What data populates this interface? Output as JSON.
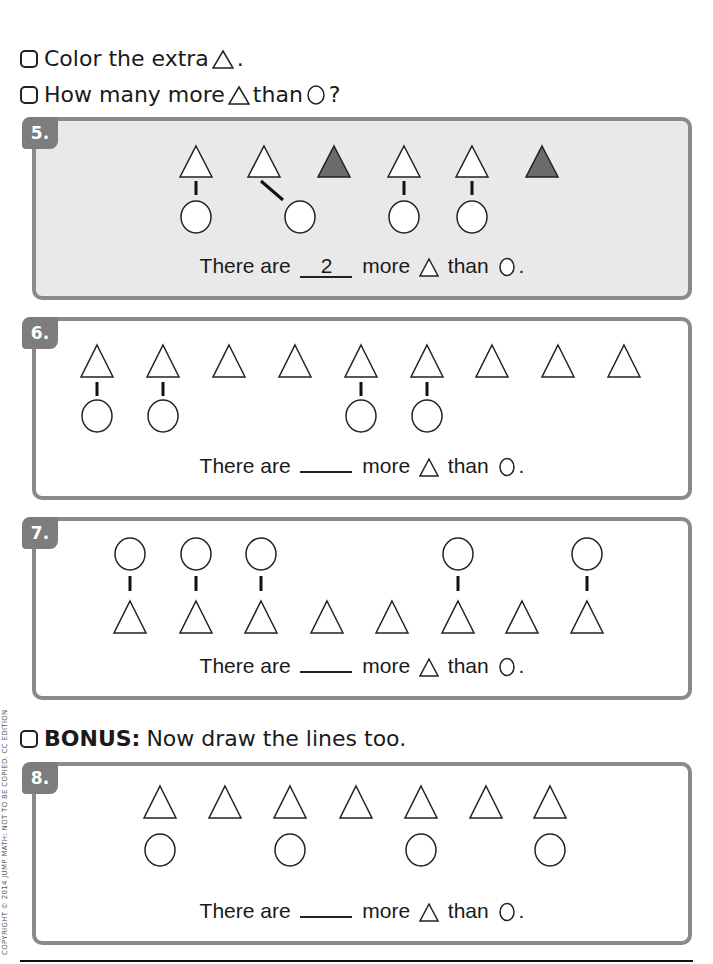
{
  "instructions": [
    {
      "text": "Color the extra",
      "suffix": "."
    },
    {
      "text": "How many more",
      "middle": "than",
      "suffix": "?"
    }
  ],
  "bonus": {
    "label": "BONUS:",
    "text": "Now draw the lines too."
  },
  "problems": [
    {
      "number": "5.",
      "sentence_start": "There are",
      "answer": "2",
      "sentence_mid": "more",
      "sentence_than": "than",
      "sentence_end": "."
    },
    {
      "number": "6.",
      "sentence_start": "There are",
      "answer": "",
      "sentence_mid": "more",
      "sentence_than": "than",
      "sentence_end": "."
    },
    {
      "number": "7.",
      "sentence_start": "There are",
      "answer": "",
      "sentence_mid": "more",
      "sentence_than": "than",
      "sentence_end": "."
    },
    {
      "number": "8.",
      "sentence_start": "There are",
      "answer": "",
      "sentence_mid": "more",
      "sentence_than": "than",
      "sentence_end": "."
    }
  ],
  "colors": {
    "panel_border": "#8a8a8a",
    "panel_shaded": "#e9e9e9",
    "badge": "#7d7d7d",
    "filled_triangle": "#6b6b6b"
  },
  "copyright": "COPYRIGHT © 2014 JUMP MATH: NOT TO BE COPIED. CC EDITION"
}
